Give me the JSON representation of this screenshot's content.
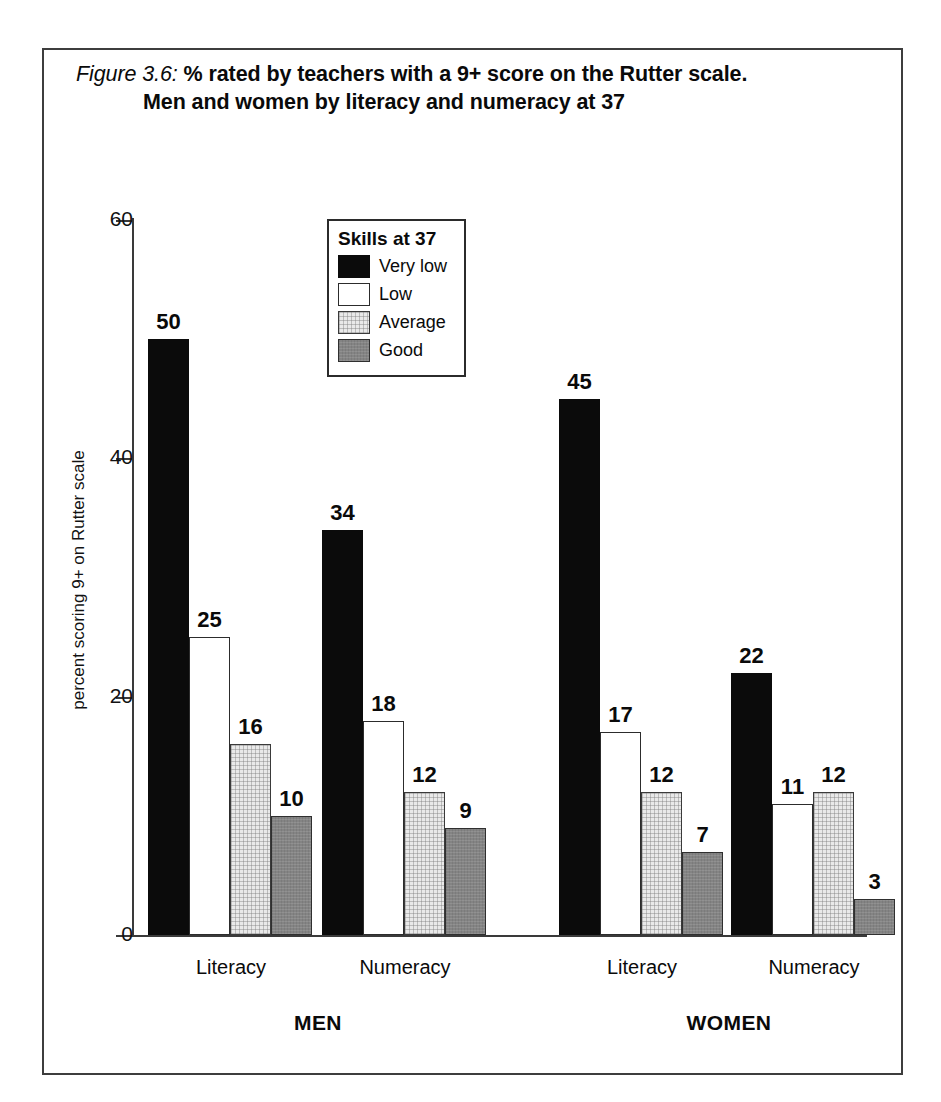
{
  "figure": {
    "title_figure_number": "Figure 3.6:",
    "title_line1_rest": " % rated by teachers with a 9+ score on the Rutter scale.",
    "title_line2": "Men and women by literacy and numeracy at 37"
  },
  "legend": {
    "title": "Skills at 37",
    "entries": [
      {
        "label": "Very low",
        "color": "#0b0b0b",
        "style": "verylow"
      },
      {
        "label": "Low",
        "color": "#ffffff",
        "style": "low"
      },
      {
        "label": "Average",
        "color": "#e9e9e9",
        "style": "average"
      },
      {
        "label": "Good",
        "color": "#848484",
        "style": "good"
      }
    ]
  },
  "axes": {
    "y_title": "percent scoring 9+ on Rutter scale",
    "y_ticks": [
      "0",
      "20",
      "40",
      "60"
    ],
    "x_category_labels": [
      "Literacy",
      "Numeracy",
      "Literacy",
      "Numeracy"
    ],
    "x_group_labels": [
      "MEN",
      "WOMEN"
    ]
  },
  "chart_data": {
    "type": "bar",
    "title": "Figure 3.6: % rated by teachers with a 9+ score on the Rutter scale. Men and women by literacy and numeracy at 37",
    "xlabel": "",
    "ylabel": "percent scoring 9+ on Rutter scale",
    "ylim": [
      0,
      60
    ],
    "yticks": [
      0,
      20,
      40,
      60
    ],
    "grid": false,
    "legend_position": "inside-top-center",
    "legend_title": "Skills at 37",
    "groups": [
      "MEN",
      "WOMEN"
    ],
    "categories": [
      "Literacy",
      "Numeracy",
      "Literacy",
      "Numeracy"
    ],
    "category_full": [
      "MEN - Literacy",
      "MEN - Numeracy",
      "WOMEN - Literacy",
      "WOMEN - Numeracy"
    ],
    "series": [
      {
        "name": "Very low",
        "color": "#0b0b0b",
        "values": [
          50,
          34,
          45,
          22
        ]
      },
      {
        "name": "Low",
        "color": "#ffffff",
        "values": [
          25,
          18,
          17,
          11
        ]
      },
      {
        "name": "Average",
        "color": "#e9e9e9",
        "values": [
          16,
          12,
          12,
          12
        ]
      },
      {
        "name": "Good",
        "color": "#848484",
        "values": [
          10,
          9,
          7,
          3
        ]
      }
    ]
  },
  "layout": {
    "baseline_y": 885,
    "px_per_unit": 11.9167,
    "bar_width": 41,
    "clusters": [
      {
        "start_x": 104,
        "category_center": 187,
        "group": "MEN"
      },
      {
        "start_x": 278,
        "category_center": 361,
        "group": "MEN"
      },
      {
        "start_x": 515,
        "category_center": 598,
        "group": "WOMEN"
      },
      {
        "start_x": 687,
        "category_center": 770,
        "group": "WOMEN"
      }
    ],
    "group_centers": [
      274,
      685
    ],
    "ytick_y": {
      "0": 885,
      "20": 647,
      "40": 408,
      "60": 170
    }
  }
}
